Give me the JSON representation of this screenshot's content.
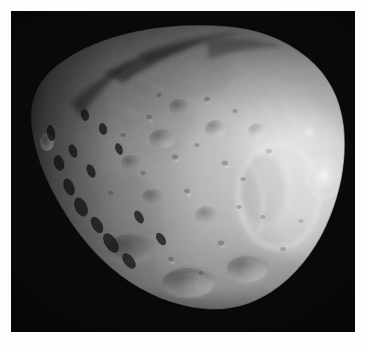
{
  "image": {
    "subject": "phobos",
    "kind": "astronomical-photograph",
    "color_mode": "grayscale",
    "alt": "Grayscale photograph of the Martian moon Phobos, a heavily cratered irregular body lit from the right, set against black space inside a white border",
    "frame": {
      "border_color": "#fdfdfd",
      "border_width_px": 11,
      "plate_width_px": 344,
      "plate_height_px": 321
    },
    "sky": {
      "background_color": "#070707",
      "noise": "sensor-grain"
    },
    "body": {
      "name": "phobos",
      "outline_fill": "#8d8d8d",
      "terminator_side": "left",
      "illumination_side": "right",
      "highlight_color": "#d9d9d9",
      "midtone_color": "#9a9a9a",
      "shadow_color": "#2a2a2a",
      "limb_bounds_px": {
        "left": 22,
        "top": 14,
        "right": 332,
        "bottom": 300
      }
    },
    "features": [
      {
        "name": "stickney-crater-region",
        "type": "crater",
        "tone": "bright-rim"
      },
      {
        "name": "limtoc-crater",
        "type": "crater",
        "tone": "bright-spot"
      },
      {
        "name": "terminator-ridge",
        "type": "ridge",
        "tone": "shadowed"
      },
      {
        "name": "grooves",
        "type": "striations",
        "tone": "linear-streaks"
      },
      {
        "name": "crater-field",
        "type": "craters",
        "tone": "mixed"
      }
    ]
  }
}
